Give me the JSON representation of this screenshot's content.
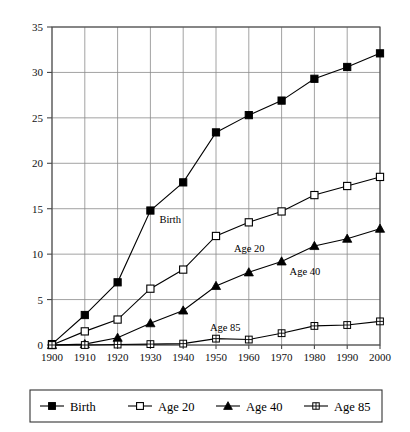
{
  "chart_data": {
    "type": "line",
    "title": "",
    "subtitle": "",
    "xlabel": "",
    "ylabel": "",
    "x": [
      1900,
      1910,
      1920,
      1930,
      1940,
      1950,
      1960,
      1970,
      1980,
      1990,
      2000
    ],
    "xtick_labels": [
      "1900",
      "1910",
      "1920",
      "1930",
      "1940",
      "1950",
      "1960",
      "1970",
      "1980",
      "1990",
      "2000"
    ],
    "ytick_labels": [
      "0",
      "5",
      "10",
      "15",
      "20",
      "25",
      "30",
      "35"
    ],
    "yticks": [
      0,
      5,
      10,
      15,
      20,
      25,
      30,
      35
    ],
    "xlim": [
      1900,
      2000
    ],
    "ylim": [
      0,
      35
    ],
    "grid": true,
    "legend_position": "bottom",
    "series": [
      {
        "name": "Birth",
        "marker": "filled-square",
        "values": [
          0.1,
          3.3,
          6.9,
          14.8,
          17.9,
          23.4,
          25.3,
          26.9,
          29.3,
          30.6,
          32.1
        ]
      },
      {
        "name": "Age 20",
        "marker": "open-square",
        "values": [
          0.0,
          1.5,
          2.8,
          6.2,
          8.3,
          12.0,
          13.5,
          14.7,
          16.5,
          17.5,
          18.5
        ]
      },
      {
        "name": "Age 40",
        "marker": "filled-triangle",
        "values": [
          0.0,
          0.1,
          0.8,
          2.4,
          3.8,
          6.5,
          8.0,
          9.2,
          10.9,
          11.7,
          12.8
        ]
      },
      {
        "name": "Age 85",
        "marker": "crossed-square",
        "values": [
          0.0,
          0.0,
          0.05,
          0.1,
          0.15,
          0.7,
          0.6,
          1.3,
          2.1,
          2.2,
          2.6
        ]
      }
    ],
    "annotations": [
      {
        "text": "Birth",
        "x": 1930,
        "y": 14.8,
        "dx": 9,
        "dy": 12
      },
      {
        "text": "Age 20",
        "x": 1950,
        "y": 12.0,
        "dx": 18,
        "dy": 16
      },
      {
        "text": "Age 40",
        "x": 1970,
        "y": 9.2,
        "dx": 8,
        "dy": 14
      },
      {
        "text": "Age 85",
        "x": 1950,
        "y": 0.7,
        "dx": -6,
        "dy": -8
      }
    ]
  },
  "legend": {
    "items": [
      {
        "label": "Birth",
        "marker": "filled-square"
      },
      {
        "label": "Age 20",
        "marker": "open-square"
      },
      {
        "label": "Age 40",
        "marker": "filled-triangle"
      },
      {
        "label": "Age 85",
        "marker": "crossed-square"
      }
    ]
  },
  "colors": {
    "ink": "#000000",
    "grid": "#8a8a8a",
    "frame": "#4a4a4a",
    "background": "#ffffff"
  }
}
